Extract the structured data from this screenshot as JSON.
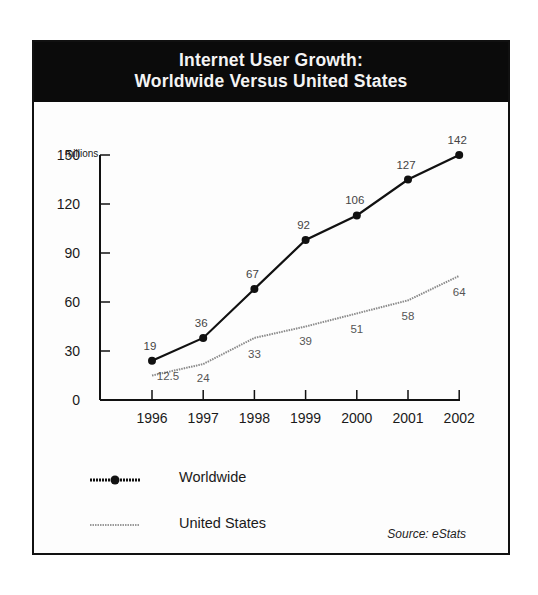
{
  "title": {
    "line1": "Internet User Growth:",
    "line2": "Worldwide Versus United States"
  },
  "source": "Source: eStats",
  "chart_data": {
    "type": "line",
    "title": "Internet User Growth: Worldwide Versus United States",
    "xlabel": "",
    "ylabel": "millions",
    "x": [
      "1996",
      "1997",
      "1998",
      "1999",
      "2000",
      "2001",
      "2002"
    ],
    "yticks": [
      0,
      30,
      60,
      90,
      120,
      150
    ],
    "ylim": [
      0,
      150
    ],
    "grid": false,
    "legend_position": "bottom-left",
    "series": [
      {
        "name": "Worldwide",
        "style": "solid-with-markers",
        "color": "#111111",
        "values": [
          19,
          36,
          67,
          92,
          106,
          127,
          142
        ],
        "labels": [
          "19",
          "36",
          "67",
          "92",
          "106",
          "127",
          "142"
        ]
      },
      {
        "name": "United States",
        "style": "dotted",
        "color": "#8a8a8a",
        "values": [
          12.5,
          24,
          33,
          39,
          51,
          58,
          64
        ],
        "labels": [
          "12.5",
          "24",
          "33",
          "39",
          "51",
          "58",
          "64"
        ]
      }
    ]
  },
  "legend": {
    "worldwide": "Worldwide",
    "united_states": "United States"
  },
  "colors": {
    "title_bg": "#0b0b0b",
    "title_text": "#f4f4f4",
    "worldwide": "#111111",
    "united_states": "#8a8a8a"
  }
}
